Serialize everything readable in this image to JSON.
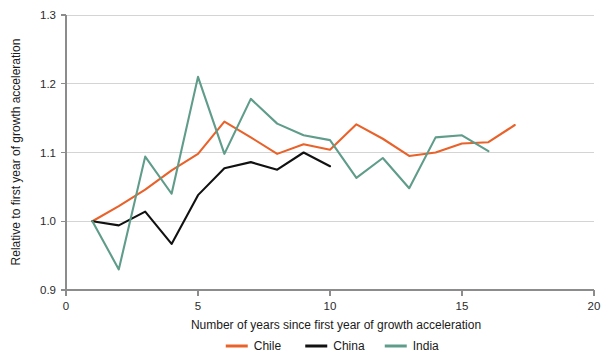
{
  "chart_data": {
    "type": "line",
    "title": "",
    "subtitle": "",
    "xlabel": "Number of years since first year of growth acceleration",
    "ylabel": "Relative to first year of growth acceleration",
    "xlim": [
      0,
      20
    ],
    "ylim": [
      0.9,
      1.3
    ],
    "xticks": [
      0,
      5,
      10,
      15,
      20
    ],
    "xtick_labels": [
      "0",
      "5",
      "10",
      "15",
      "20"
    ],
    "yticks": [
      0.9,
      1.0,
      1.1,
      1.2,
      1.3
    ],
    "ytick_labels": [
      "0.9",
      "1.0",
      "1.1",
      "1.2",
      "1.3"
    ],
    "grid": "horizontal",
    "legend_position": "bottom",
    "series": [
      {
        "name": "Chile",
        "color": "#e8622a",
        "x": [
          1,
          2,
          3,
          4,
          5,
          6,
          7,
          8,
          9,
          10,
          11,
          12,
          13,
          14,
          15,
          16,
          17
        ],
        "values": [
          1.0,
          1.022,
          1.046,
          1.074,
          1.098,
          1.145,
          1.122,
          1.098,
          1.112,
          1.104,
          1.141,
          1.12,
          1.095,
          1.1,
          1.113,
          1.115,
          1.14
        ]
      },
      {
        "name": "China",
        "color": "#111111",
        "x": [
          1,
          2,
          3,
          4,
          5,
          6,
          7,
          8,
          9,
          10
        ],
        "values": [
          1.0,
          0.994,
          1.014,
          0.967,
          1.038,
          1.077,
          1.086,
          1.075,
          1.1,
          1.08
        ]
      },
      {
        "name": "India",
        "color": "#5f9c8a",
        "x": [
          1,
          2,
          3,
          4,
          5,
          6,
          7,
          8,
          9,
          10,
          11,
          12,
          13,
          14,
          15,
          16
        ],
        "values": [
          1.0,
          0.93,
          1.094,
          1.04,
          1.21,
          1.098,
          1.178,
          1.142,
          1.125,
          1.118,
          1.063,
          1.092,
          1.048,
          1.122,
          1.125,
          1.102
        ]
      }
    ],
    "legend": [
      {
        "label": "Chile",
        "color": "#e8622a"
      },
      {
        "label": "China",
        "color": "#111111"
      },
      {
        "label": "India",
        "color": "#5f9c8a"
      }
    ]
  }
}
